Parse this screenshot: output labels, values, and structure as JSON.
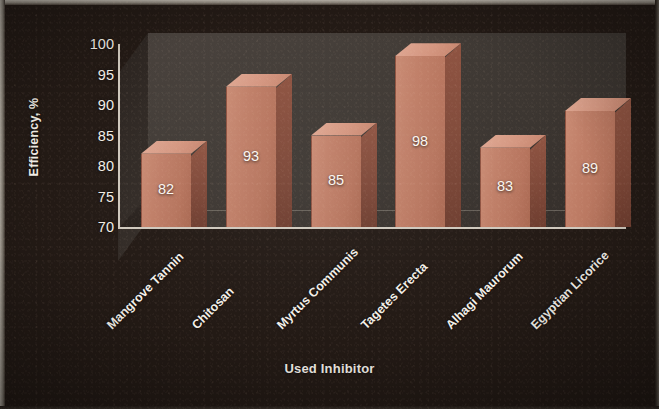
{
  "chart_data": {
    "type": "bar",
    "title": "",
    "xlabel": "Used Inhibitor",
    "ylabel": "Efficiency, %",
    "categories": [
      "Mangrove Tannin",
      "Chitosan",
      "Myrtus Communis",
      "Tagetes Erecta",
      "Alhagi Maurorum",
      "Egyptian Licorice"
    ],
    "values": [
      82,
      93,
      85,
      98,
      83,
      89
    ],
    "value_labels": [
      "82",
      "93",
      "85",
      "98",
      "83",
      "89"
    ],
    "ylim": [
      70,
      100
    ],
    "ytick_labels": [
      "100",
      "95",
      "90",
      "85",
      "80",
      "75",
      "70"
    ],
    "ytick_values": [
      100,
      95,
      90,
      85,
      80,
      75,
      70
    ],
    "grid": false,
    "legend": false,
    "legend_position": "none",
    "style": "3d-column",
    "bar_color": "#c07f68",
    "bar_top_color": "#d49680",
    "bar_side_color": "#7d4737",
    "plot_background": "#3e3833",
    "figure_background": "#231a15",
    "text_color": "#f3efe8",
    "axis_color": "#cfc8bd"
  }
}
